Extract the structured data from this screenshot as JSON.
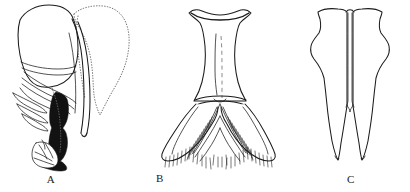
{
  "figure": {
    "kind": "scientific-line-drawing",
    "background_color": "#ffffff",
    "ink_color": "#1b1b1b",
    "dotted_color": "#6a6a6a",
    "fill_color": "#121212",
    "width": 410,
    "height": 192,
    "panels": [
      {
        "id": "A",
        "label": "A",
        "label_x": 51,
        "label_y": 173,
        "description": "lateral view outline with solid black internal structure, pale hatched apical piece and dotted ghost outline at upper right",
        "features": [
          "large anterior plate outline",
          "dotted ghost outline",
          "black sclerotised rod",
          "fringed lamella",
          "stippled apical lobe"
        ]
      },
      {
        "id": "B",
        "label": "B",
        "label_x": 228,
        "label_y": 173,
        "description": "hourglass to trapezoid plate with concave apical margin, dashed median line and paired lateral lobes bearing dense marginal setae",
        "features": [
          "concave apical margin",
          "dashed median line",
          "transverse bridge",
          "paired lateral lobes",
          "dense marginal setae"
        ]
      },
      {
        "id": "C",
        "label": "C",
        "label_x": 351,
        "label_y": 173,
        "description": "paired elongate parallel-sided lobes, widened medially, tapering to acute divergent apices, separated by a narrow median cleft",
        "features": [
          "paired elongate lobes",
          "median cleft",
          "medial expansion",
          "acute divergent apices"
        ]
      }
    ]
  }
}
